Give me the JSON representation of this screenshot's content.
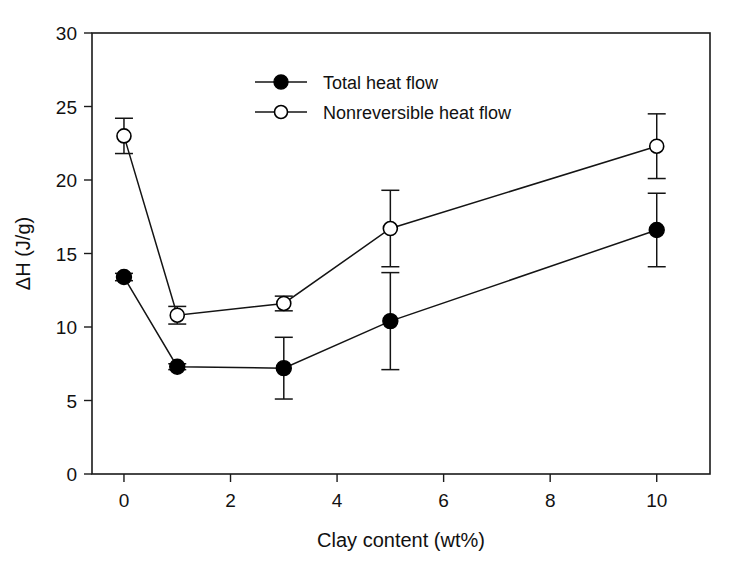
{
  "chart_data": {
    "type": "line",
    "title": "",
    "xlabel": "Clay content (wt%)",
    "ylabel": "ΔH (J/g)",
    "xlim": [
      -0.6,
      11.0
    ],
    "ylim": [
      0,
      30
    ],
    "xticks": [
      0,
      2,
      4,
      6,
      8,
      10
    ],
    "xtick_labels": [
      "0",
      "2",
      "4",
      "6",
      "8",
      "10"
    ],
    "yticks": [
      0,
      5,
      10,
      15,
      20,
      25,
      30
    ],
    "ytick_labels": [
      "0",
      "5",
      "10",
      "15",
      "20",
      "25",
      "30"
    ],
    "grid": false,
    "legend_position": "top-center",
    "x": [
      0,
      1,
      3,
      5,
      10
    ],
    "series": [
      {
        "name": "Total heat flow",
        "marker": "filled-circle",
        "values": [
          13.4,
          7.3,
          7.2,
          10.4,
          16.6
        ],
        "errors": [
          0.25,
          0.2,
          2.1,
          3.3,
          2.5
        ]
      },
      {
        "name": "Nonreversible heat flow",
        "marker": "open-circle",
        "values": [
          23.0,
          10.8,
          11.6,
          16.7,
          22.3
        ],
        "errors": [
          1.2,
          0.6,
          0.5,
          2.6,
          2.2
        ]
      }
    ]
  },
  "legend": {
    "entries": [
      {
        "label": "Total heat flow",
        "marker": "filled-circle"
      },
      {
        "label": "Nonreversible heat flow",
        "marker": "open-circle"
      }
    ]
  },
  "colors": {
    "axis": "#1a1a1a",
    "series": "#141414",
    "background": "#ffffff",
    "marker_fill_total": "#000000",
    "marker_fill_nonreversible": "#ffffff"
  }
}
